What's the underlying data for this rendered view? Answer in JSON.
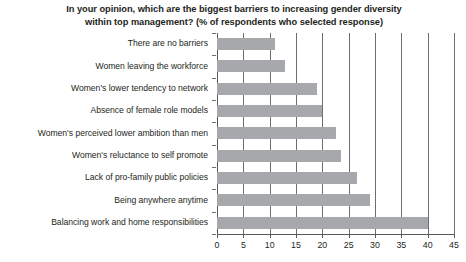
{
  "chart_data": {
    "type": "bar",
    "orientation": "horizontal",
    "title": "In your opinion, which are the biggest barriers to increasing gender diversity within top management? (% of respondents who selected response)",
    "title_lines": [
      "In your opinion, which are the biggest barriers to increasing gender diversity",
      "within top management? (% of respondents who selected response)"
    ],
    "xlabel": "",
    "ylabel": "",
    "xlim": [
      0,
      45
    ],
    "xticks": [
      0,
      5,
      10,
      15,
      20,
      25,
      30,
      35,
      40,
      45
    ],
    "xtick_labels": [
      "0",
      "5",
      "10",
      "15",
      "20",
      "25",
      "30",
      "35",
      "40",
      "45"
    ],
    "grid": "vertical",
    "legend": "none",
    "bar_color": "#a6a8ab",
    "categories": [
      "There are no barriers",
      "Women leaving the workforce",
      "Women's lower tendency to network",
      "Absence of female role models",
      "Women's perceived lower ambition than men",
      "Women's reluctance to self promote",
      "Lack of pro-family public policies",
      "Being anywhere anytime",
      "Balancing work and home responsibilities"
    ],
    "values": [
      11,
      13,
      19,
      20,
      22.5,
      23.5,
      26.5,
      29,
      40
    ]
  }
}
